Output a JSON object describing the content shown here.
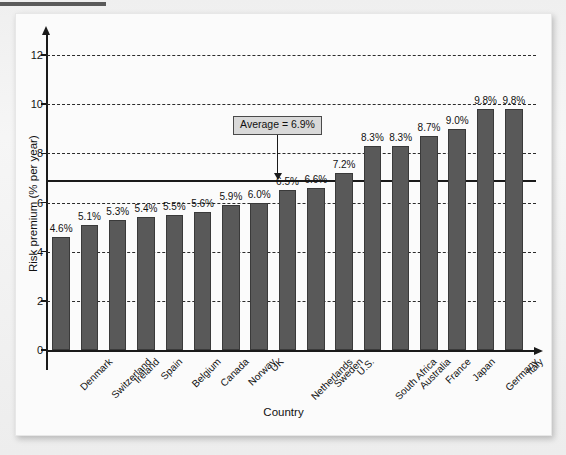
{
  "chart_data": {
    "type": "bar",
    "title": "",
    "xlabel": "Country",
    "ylabel": "Risk premium (% per year)",
    "ylim": [
      0,
      12
    ],
    "yticks": [
      0,
      2,
      4,
      6,
      8,
      10,
      12
    ],
    "ytick_labels": [
      "0",
      "2",
      "4",
      "6",
      "8",
      "10",
      "12"
    ],
    "grid": "horizontal-dashed",
    "legend": "none",
    "categories": [
      "Denmark",
      "Switzerland",
      "Ireland",
      "Spain",
      "Belgium",
      "Canada",
      "Norway",
      "UK",
      "Netherlands",
      "Sweden",
      "U.S.",
      "South Africa",
      "Australia",
      "France",
      "Japan",
      "Germany",
      "Italy"
    ],
    "values": [
      4.6,
      5.1,
      5.3,
      5.4,
      5.5,
      5.6,
      5.9,
      6.0,
      6.5,
      6.6,
      7.2,
      8.3,
      8.3,
      8.7,
      9.0,
      9.8,
      9.8
    ],
    "value_labels": [
      "4.6%",
      "5.1%",
      "5.3%",
      "5.4%",
      "5.5%",
      "5.6%",
      "5.9%",
      "6.0%",
      "6.5%",
      "6.6%",
      "7.2%",
      "8.3%",
      "8.3%",
      "8.7%",
      "9.0%",
      "9.8%",
      "9.8%"
    ],
    "bar_color": "#595959",
    "annotations": [
      {
        "name": "average-line",
        "label": "Average = 6.9%",
        "value": 6.9,
        "style": "solid-horizontal-line-with-boxed-callout-and-arrow"
      }
    ]
  },
  "colors": {
    "bar": "#595959",
    "bar_edge": "#3a3a3a",
    "axis": "#1a1a1a",
    "grid": "#2b2b2b",
    "callout_fill": "#d9d9d9",
    "card": "#fbfbfb",
    "page": "#f3f3f3"
  }
}
